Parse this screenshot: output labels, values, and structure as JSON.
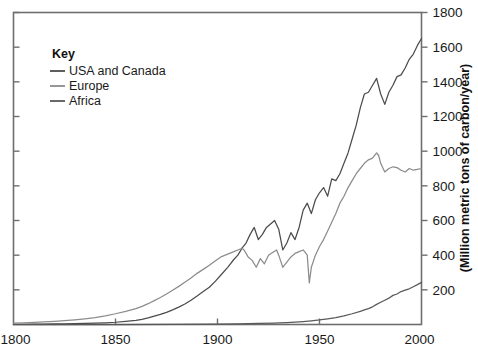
{
  "chart_data": {
    "type": "line",
    "title": "",
    "xlabel": "",
    "ylabel": "(Million metric tons of carbon/year)",
    "xlim": [
      1800,
      2000
    ],
    "ylim": [
      0,
      1800
    ],
    "xticks": [
      1800,
      1850,
      1900,
      1950,
      2000
    ],
    "xtick_labels": [
      "1800",
      "1850",
      "1900",
      "1950",
      "2000"
    ],
    "yticks": [
      200,
      400,
      600,
      800,
      1000,
      1200,
      1400,
      1600,
      1800
    ],
    "ytick_labels": [
      "200",
      "400",
      "600",
      "800",
      "1000",
      "1200",
      "1400",
      "1600",
      "1800"
    ],
    "y_axis_side": "right",
    "grid": false,
    "legend_position": "top-left",
    "legend_title": "Key",
    "series": [
      {
        "name": "USA and Canada",
        "color": "#4c4c4c",
        "x": [
          1800,
          1805,
          1810,
          1815,
          1820,
          1825,
          1830,
          1835,
          1840,
          1845,
          1850,
          1855,
          1860,
          1863,
          1866,
          1869,
          1872,
          1875,
          1878,
          1881,
          1884,
          1887,
          1890,
          1893,
          1896,
          1899,
          1902,
          1905,
          1908,
          1910,
          1912,
          1914,
          1916,
          1918,
          1920,
          1922,
          1924,
          1926,
          1928,
          1930,
          1932,
          1934,
          1936,
          1938,
          1940,
          1942,
          1944,
          1946,
          1948,
          1950,
          1952,
          1954,
          1956,
          1958,
          1960,
          1962,
          1964,
          1966,
          1968,
          1970,
          1972,
          1974,
          1976,
          1978,
          1980,
          1982,
          1984,
          1986,
          1988,
          1990,
          1992,
          1994,
          1996,
          1998,
          2000
        ],
        "y": [
          1,
          1,
          2,
          2,
          3,
          4,
          5,
          6,
          8,
          10,
          13,
          18,
          24,
          30,
          38,
          48,
          58,
          70,
          84,
          100,
          118,
          140,
          165,
          190,
          215,
          250,
          290,
          330,
          375,
          400,
          440,
          470,
          520,
          560,
          490,
          520,
          560,
          580,
          600,
          550,
          430,
          470,
          530,
          490,
          560,
          660,
          700,
          640,
          720,
          760,
          790,
          740,
          840,
          830,
          870,
          930,
          990,
          1070,
          1150,
          1250,
          1330,
          1340,
          1380,
          1420,
          1330,
          1270,
          1340,
          1380,
          1430,
          1440,
          1480,
          1530,
          1560,
          1610,
          1650
        ]
      },
      {
        "name": "Europe",
        "color": "#8c8c8c",
        "x": [
          1800,
          1805,
          1810,
          1815,
          1820,
          1825,
          1830,
          1835,
          1840,
          1845,
          1850,
          1855,
          1860,
          1863,
          1866,
          1869,
          1872,
          1875,
          1878,
          1881,
          1884,
          1887,
          1890,
          1893,
          1896,
          1899,
          1902,
          1905,
          1908,
          1910,
          1912,
          1913,
          1915,
          1917,
          1919,
          1921,
          1923,
          1925,
          1927,
          1929,
          1930,
          1932,
          1934,
          1936,
          1938,
          1940,
          1942,
          1944,
          1945,
          1946,
          1948,
          1950,
          1952,
          1954,
          1956,
          1958,
          1960,
          1962,
          1964,
          1966,
          1968,
          1970,
          1972,
          1974,
          1976,
          1978,
          1979,
          1980,
          1982,
          1984,
          1986,
          1988,
          1990,
          1992,
          1994,
          1996,
          1998,
          2000
        ],
        "y": [
          8,
          10,
          12,
          15,
          18,
          22,
          27,
          33,
          40,
          50,
          62,
          76,
          92,
          105,
          120,
          138,
          156,
          176,
          198,
          220,
          244,
          268,
          295,
          318,
          342,
          368,
          392,
          406,
          420,
          430,
          440,
          430,
          390,
          370,
          330,
          380,
          350,
          400,
          415,
          430,
          400,
          330,
          360,
          390,
          410,
          420,
          430,
          400,
          240,
          330,
          400,
          450,
          490,
          540,
          590,
          640,
          700,
          740,
          790,
          830,
          870,
          900,
          930,
          950,
          960,
          990,
          975,
          930,
          880,
          900,
          910,
          905,
          890,
          880,
          900,
          890,
          895,
          900
        ]
      },
      {
        "name": "Africa",
        "color": "#595959",
        "x": [
          1800,
          1850,
          1880,
          1900,
          1910,
          1920,
          1928,
          1930,
          1934,
          1938,
          1942,
          1946,
          1950,
          1954,
          1958,
          1962,
          1966,
          1970,
          1972,
          1974,
          1976,
          1978,
          1980,
          1982,
          1984,
          1986,
          1988,
          1990,
          1992,
          1994,
          1996,
          1998,
          2000
        ],
        "y": [
          0,
          0,
          1,
          2,
          4,
          6,
          8,
          9,
          11,
          14,
          17,
          21,
          26,
          33,
          40,
          50,
          62,
          76,
          84,
          92,
          102,
          116,
          128,
          140,
          152,
          168,
          176,
          190,
          198,
          206,
          218,
          230,
          243
        ]
      }
    ]
  },
  "legend": {
    "title": "Key",
    "items": [
      {
        "label": "USA and Canada",
        "color": "#4c4c4c",
        "swatch": "line-swatch"
      },
      {
        "label": "Europe",
        "color": "#8c8c8c",
        "swatch": "line-swatch"
      },
      {
        "label": "Africa",
        "color": "#595959",
        "swatch": "line-swatch"
      }
    ]
  },
  "axes": {
    "y_title": "(Million metric tons of carbon/year)",
    "x_tick_labels": [
      "1800",
      "1850",
      "1900",
      "1950",
      "2000"
    ],
    "y_tick_labels": [
      "200",
      "400",
      "600",
      "800",
      "1000",
      "1200",
      "1400",
      "1600",
      "1800"
    ]
  }
}
